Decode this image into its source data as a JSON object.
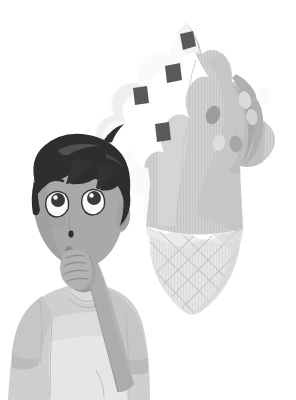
{
  "scene": {
    "title": "Boy Imagining an Ice Cream Cone",
    "description": "Grayscale children's book style illustration of a young boy in a t-shirt with his hand on his chin, looking up at a large soft-serve ice cream cone floating in the air.",
    "background_color": "#ffffff",
    "width": 296,
    "height": 400,
    "style": "grayscale cartoon illustration"
  },
  "palette": {
    "background": "#ffffff",
    "hair_dark": "#2e2e2e",
    "hair_highlight": "#4a4a4a",
    "skin_base": "#a9a9a9",
    "skin_shadow": "#939393",
    "skin_light": "#b8b8b8",
    "eye_white": "#fbfbfb",
    "eye_iris": "#3a3a3a",
    "line_dark": "#2b2b2b",
    "shirt_base": "#c9c9c9",
    "shirt_light": "#dcdcdc",
    "shirt_panel": "#e4e4e4",
    "shirt_shadow": "#b4b4b4",
    "shirt_outline": "#b0b0b0",
    "cream_white": "#f7f7f7",
    "cream_light": "#ebebeb",
    "cream_mid": "#cfcfcf",
    "cream_gray": "#c2c2c2",
    "cream_dark": "#a8a8a8",
    "chip_dark": "#5a5a5a",
    "sprinkle_light": "#d8d8d8",
    "sprinkle_mid": "#9e9e9e",
    "cone_fill": "#e3e3e3",
    "cone_line": "#c0c0c0",
    "cone_shadow": "#cfcfcf"
  },
  "character": {
    "name": "boy",
    "pose": "thinking, hand on chin, gazing upward",
    "expression": "curious, mouth slightly open",
    "parts": {
      "hair": "short dark spiky hair with fringe and cowlick",
      "face": "oval face, raised eyebrows",
      "left_eye": "white sclera with large dark iris looking up",
      "right_eye": "white sclera with large dark iris looking up",
      "nose": "small dark dot",
      "mouth": "small open oval",
      "ear": "partially hidden under hair on right",
      "neck": "visible under chin",
      "hand": "curled fingers resting against chin",
      "arm": "right arm raised and bent",
      "shirt": "short sleeved t-shirt with lighter front panel"
    }
  },
  "ice_cream": {
    "name": "soft-serve ice cream cone",
    "position": "upper right, floating",
    "swirl": "tall twisted soft-serve swirl, white on left, gray on right",
    "cone": "waffle cone with diamond crosshatch lattice",
    "toppings": {
      "chocolate_chunks": 4,
      "sprinkles": 6,
      "chunk_shape": "angular dark quadrilaterals",
      "sprinkle_shape": "light ovals and circles"
    }
  },
  "a11y": {
    "alt_text": "A grayscale illustration of a thoughtful boy with his hand on his chin looking up at a large floating soft-serve ice cream cone topped with chocolate chunks and sprinkles."
  }
}
